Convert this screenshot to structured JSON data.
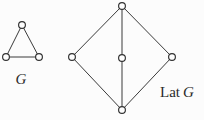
{
  "figure": {
    "background_color": "#fcfcfc",
    "edge_color": "#3a3a3a",
    "node_fill_color": "#fdfdfd",
    "node_stroke_color": "#303030",
    "label_color": "#2b2b2b",
    "node_radius": 3.4,
    "edge_width": 1
  },
  "graph_g": {
    "name": "G",
    "label_text": "G",
    "label_prefix": "",
    "label_italic": "G",
    "label_x": 21,
    "label_y": 84,
    "description": "triangle graph on three vertices",
    "nodes": [
      {
        "id": "a",
        "name": "apex-vertex",
        "x": 22,
        "y": 25
      },
      {
        "id": "b",
        "name": "bottom-left-vertex",
        "x": 6,
        "y": 57
      },
      {
        "id": "c",
        "name": "bottom-right-vertex",
        "x": 39,
        "y": 57
      }
    ],
    "edges": [
      {
        "from": "a",
        "to": "b"
      },
      {
        "from": "a",
        "to": "c"
      },
      {
        "from": "b",
        "to": "c"
      }
    ]
  },
  "lattice_lat_g": {
    "name": "Lat G",
    "label_text": "Lat G",
    "label_prefix": "Lat ",
    "label_italic": "G",
    "label_x": 160,
    "label_y": 97,
    "description": "diamond lattice M3 with top element, three atoms and bottom element",
    "nodes": [
      {
        "id": "top",
        "name": "top-element-node",
        "x": 122,
        "y": 6
      },
      {
        "id": "left",
        "name": "left-atom-node",
        "x": 72,
        "y": 57
      },
      {
        "id": "middle",
        "name": "middle-atom-node",
        "x": 122,
        "y": 58
      },
      {
        "id": "right",
        "name": "right-atom-node",
        "x": 172,
        "y": 57
      },
      {
        "id": "bottom",
        "name": "bottom-element-node",
        "x": 122,
        "y": 110
      }
    ],
    "edges": [
      {
        "from": "top",
        "to": "left"
      },
      {
        "from": "top",
        "to": "middle"
      },
      {
        "from": "top",
        "to": "right"
      },
      {
        "from": "left",
        "to": "bottom"
      },
      {
        "from": "middle",
        "to": "bottom"
      },
      {
        "from": "right",
        "to": "bottom"
      }
    ]
  }
}
